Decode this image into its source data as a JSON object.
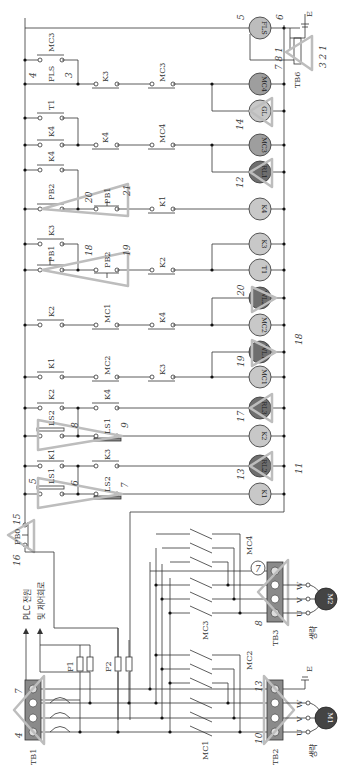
{
  "diagram": {
    "title": "PLC 전원 및 제어회로",
    "orientation": "rotated-90-clockwise",
    "power_section": {
      "terminal_blocks": [
        {
          "id": "TB1",
          "label": "TB1",
          "terminals": 4,
          "marker_numbers": [
            "4",
            "7"
          ]
        },
        {
          "id": "TB2",
          "label": "TB2",
          "terminals": 4,
          "marker_numbers": [
            "10",
            "13"
          ]
        },
        {
          "id": "TB3",
          "label": "TB3",
          "terminals": 4,
          "marker_numbers": [
            "8",
            "7"
          ]
        }
      ],
      "fuses": [
        {
          "label": "F1"
        },
        {
          "label": "F2"
        }
      ],
      "contactors": [
        {
          "label": "MC1"
        },
        {
          "label": "MC2"
        },
        {
          "label": "MC3"
        },
        {
          "label": "MC4"
        }
      ],
      "motors": [
        {
          "label": "M1",
          "phases": [
            "U",
            "V",
            "W"
          ],
          "note": "생략",
          "ground": "E"
        },
        {
          "label": "M2",
          "phases": [
            "U",
            "V",
            "W"
          ],
          "note": "생략"
        }
      ],
      "plc_note_line1": "PLC 전원",
      "plc_note_line2": "및 제어회로",
      "pb0": {
        "label": "PB0",
        "numbers": [
          "15",
          "16"
        ]
      }
    },
    "control_rungs": [
      {
        "coil": "K1",
        "contacts": [
          "LS1",
          "LS2"
        ],
        "coil_color": "light",
        "numbers": [
          "5",
          "6",
          "7"
        ]
      },
      {
        "coil": "RL2",
        "contacts": [
          "K1",
          "K3"
        ],
        "coil_color": "dark",
        "lamp_number": "13"
      },
      {
        "coil": "K2",
        "contacts": [
          "K1",
          "LS1"
        ],
        "coil_color": "light",
        "parallel": "LS2",
        "numbers": [
          "8",
          "9"
        ]
      },
      {
        "coil": "RL3",
        "contacts": [
          "K2",
          "K4"
        ],
        "coil_color": "dark",
        "lamp_number": "17"
      },
      {
        "coil": "MC1",
        "contacts": [
          "K1",
          "MC2",
          "K3"
        ],
        "coil_color": "light"
      },
      {
        "coil": "WL1",
        "coil_color": "dark",
        "lamp_number": "19"
      },
      {
        "coil": "MC2",
        "contacts": [
          "K2",
          "MC1",
          "K4"
        ],
        "coil_color": "light"
      },
      {
        "coil": "WL2",
        "coil_color": "dark",
        "lamp_number": "20"
      },
      {
        "coil": "T1",
        "contacts": [
          "PB1",
          "PB2",
          "K2"
        ],
        "coil_color": "light",
        "numbers": [
          "18",
          "19"
        ]
      },
      {
        "coil": "K3",
        "contacts": [
          "K3"
        ],
        "coil_color": "light"
      },
      {
        "coil": "K4",
        "contacts": [
          "PB2",
          "PB1",
          "K1"
        ],
        "coil_color": "light",
        "numbers": [
          "20",
          "21"
        ]
      },
      {
        "coil": "RL1",
        "coil_color": "dark",
        "lamp_number": "12"
      },
      {
        "coil": "MC3",
        "contacts": [
          "K4",
          "T1",
          "K4",
          "MC4"
        ],
        "coil_color": "light"
      },
      {
        "coil": "GL",
        "coil_color": "light",
        "lamp_number": "14"
      },
      {
        "coil": "MC4",
        "contacts": [
          "MC3",
          "FLS",
          "K3",
          "MC3"
        ],
        "coil_color": "light",
        "numbers": [
          "4",
          "3"
        ]
      },
      {
        "coil": "FLS",
        "coil_color": "light",
        "numbers": [
          "5",
          "6"
        ]
      }
    ],
    "tb6": {
      "label": "TB6",
      "numbers": [
        "7",
        "8",
        "1",
        "3",
        "2",
        "1"
      ],
      "ground": "E"
    },
    "rail_numbers": [
      "11",
      "18"
    ]
  }
}
